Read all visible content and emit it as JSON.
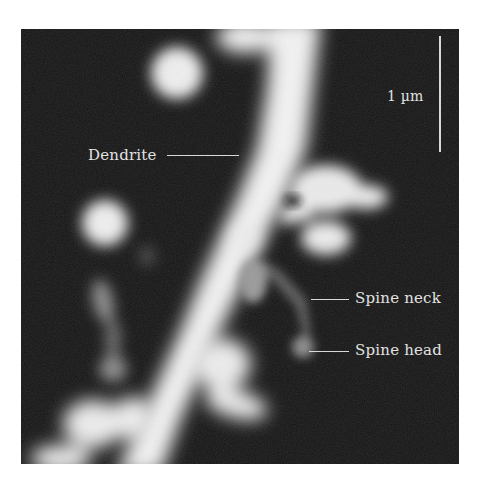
{
  "figure": {
    "type": "fluorescence micrograph",
    "background_color": "#141414",
    "signal_color": "#f2f2f2"
  },
  "scale_bar": {
    "label": "1 µm"
  },
  "annotations": [
    {
      "id": "dendrite",
      "label": "Dendrite"
    },
    {
      "id": "spine-neck",
      "label": "Spine neck"
    },
    {
      "id": "spine-head",
      "label": "Spine head"
    }
  ]
}
